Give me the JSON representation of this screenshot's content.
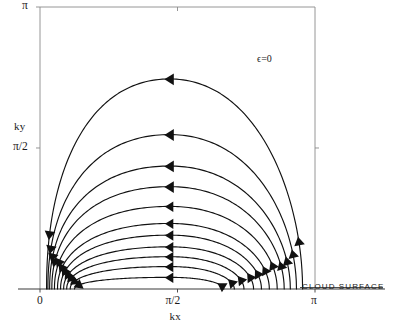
{
  "figure": {
    "annotation": "ϵ=0",
    "surface_label": "CLOUD SURFACE"
  },
  "axes": {
    "x_axis_label": "kx",
    "y_axis_label": "ky",
    "x_ticks": [
      {
        "label": "0",
        "value": 0
      },
      {
        "label": "π/2",
        "value": 1.5708
      },
      {
        "label": "π",
        "value": 3.14159
      }
    ],
    "y_ticks": [
      {
        "label": "π/2",
        "value": 1.5708
      },
      {
        "label": "π",
        "value": 3.14159
      }
    ]
  },
  "chart_data": {
    "type": "line",
    "title": "",
    "xlabel": "kx",
    "ylabel": "ky",
    "xlim": [
      0,
      3.14159
    ],
    "ylim": [
      0,
      3.14159
    ],
    "xtick_labels": [
      "0",
      "π/2",
      "π"
    ],
    "xtick_values": [
      0,
      1.5708,
      3.14159
    ],
    "ytick_labels": [
      "π/2",
      "π"
    ],
    "ytick_values": [
      1.5708,
      3.14159
    ],
    "grid": false,
    "legend": null,
    "annotations": [
      {
        "text": "ϵ=0",
        "x": 2.48,
        "y": 2.63
      },
      {
        "text": "CLOUD SURFACE",
        "x": 2.62,
        "y": 0.08
      }
    ],
    "series": [
      {
        "name": "trajectory-1",
        "apex_ky": 2.34,
        "start_kx": 0.075,
        "end_kx": 3.0,
        "apex_kx": 1.48,
        "arrow_dir": "left"
      },
      {
        "name": "trajectory-2",
        "apex_ky": 1.72,
        "start_kx": 0.09,
        "end_kx": 2.93,
        "apex_kx": 1.48,
        "arrow_dir": "left"
      },
      {
        "name": "trajectory-3",
        "apex_ky": 1.37,
        "start_kx": 0.11,
        "end_kx": 2.86,
        "apex_kx": 1.48,
        "arrow_dir": "left"
      },
      {
        "name": "trajectory-4",
        "apex_ky": 1.14,
        "start_kx": 0.135,
        "end_kx": 2.79,
        "apex_kx": 1.48,
        "arrow_dir": "left"
      },
      {
        "name": "trajectory-5",
        "apex_ky": 0.92,
        "start_kx": 0.165,
        "end_kx": 2.71,
        "apex_kx": 1.48,
        "arrow_dir": "left"
      },
      {
        "name": "trajectory-6",
        "apex_ky": 0.73,
        "start_kx": 0.2,
        "end_kx": 2.62,
        "apex_kx": 1.48,
        "arrow_dir": "left"
      },
      {
        "name": "trajectory-7",
        "apex_ky": 0.6,
        "start_kx": 0.235,
        "end_kx": 2.53,
        "apex_kx": 1.48,
        "arrow_dir": "left"
      },
      {
        "name": "trajectory-8",
        "apex_ky": 0.47,
        "start_kx": 0.27,
        "end_kx": 2.44,
        "apex_kx": 1.48,
        "arrow_dir": "left"
      },
      {
        "name": "trajectory-9",
        "apex_ky": 0.36,
        "start_kx": 0.305,
        "end_kx": 2.33,
        "apex_kx": 1.48,
        "arrow_dir": "left"
      },
      {
        "name": "trajectory-10",
        "apex_ky": 0.25,
        "start_kx": 0.345,
        "end_kx": 2.22,
        "apex_kx": 1.48,
        "arrow_dir": "left"
      },
      {
        "name": "trajectory-11",
        "apex_ky": 0.13,
        "start_kx": 0.395,
        "end_kx": 2.1,
        "apex_kx": 1.48,
        "arrow_dir": "left"
      }
    ],
    "left_arrows": {
      "direction": "down",
      "count": 11
    },
    "right_arrows": {
      "direction": "up",
      "count": 11
    }
  },
  "geometry": {
    "plot_left_px": 40,
    "plot_right_px": 315,
    "plot_top_px": 7,
    "plot_bottom_px": 289
  }
}
